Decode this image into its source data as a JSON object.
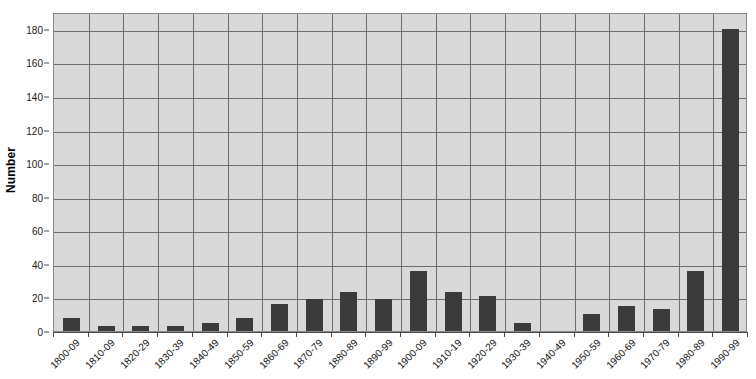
{
  "chart_data": {
    "type": "bar",
    "title": "",
    "subtitle": "",
    "xlabel": "",
    "ylabel": "Number",
    "ylim": [
      0,
      190
    ],
    "yticks": [
      0,
      20,
      40,
      60,
      80,
      100,
      120,
      140,
      160,
      180
    ],
    "ytick_labels": [
      "0",
      "20",
      "40",
      "60",
      "80",
      "100",
      "120",
      "140",
      "160",
      "180"
    ],
    "grid": "horizontal-and-vertical",
    "legend": "none",
    "categories": [
      "1800-09",
      "1810-09",
      "1820-29",
      "1830-39",
      "1840-49",
      "1850-59",
      "1860-69",
      "1870-79",
      "1880-89",
      "1890-99",
      "1900-09",
      "1910-19",
      "1920-29",
      "1930-39",
      "1940-49",
      "1950-59",
      "1960-69",
      "1970-79",
      "1980-89",
      "1990-99"
    ],
    "values": [
      8,
      3,
      3,
      3,
      5,
      8,
      16,
      19,
      23,
      19,
      36,
      23,
      21,
      5,
      0,
      10,
      15,
      13,
      36,
      180
    ],
    "bar_color": "#3b3b3b",
    "plot_background_color": "#d9d9d9",
    "gridline_color": "#6e6e6e",
    "axis_color": "#4a4a4a",
    "figure_background_color": "#ffffff"
  }
}
